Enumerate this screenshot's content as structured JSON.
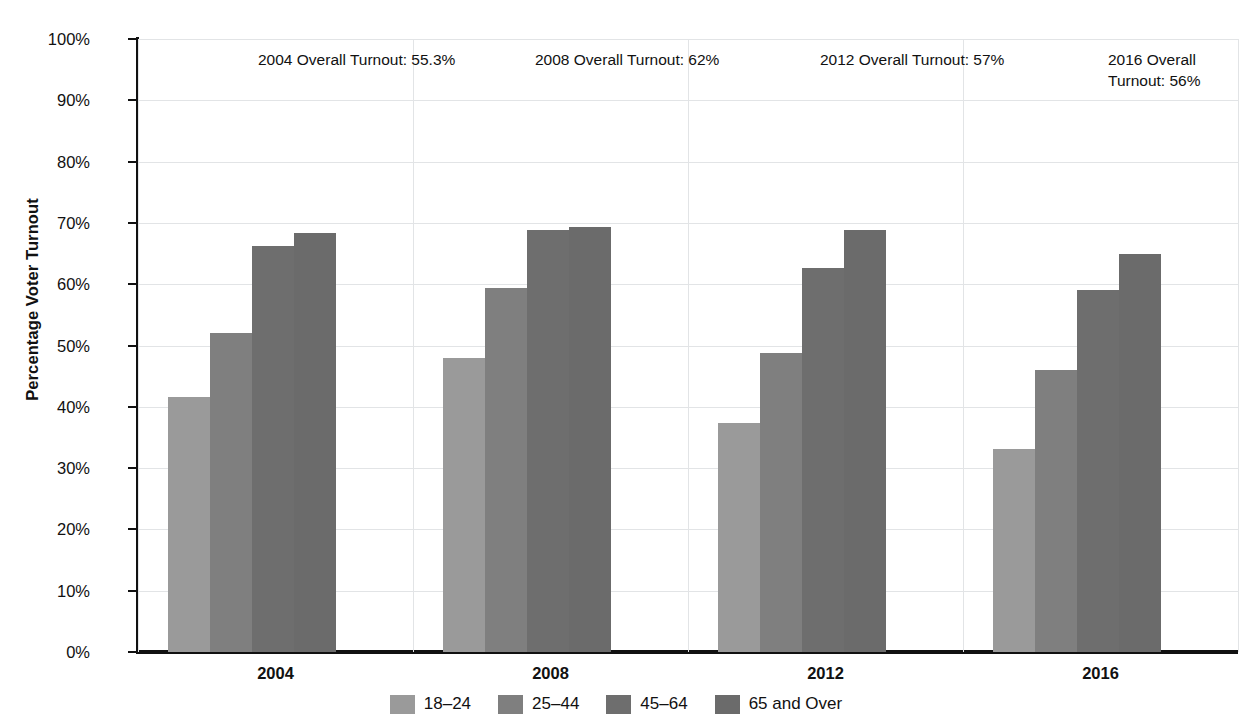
{
  "chart_data": {
    "type": "bar",
    "title": "",
    "xlabel": "",
    "ylabel": "Percentage Voter Turnout",
    "categories": [
      "2004",
      "2008",
      "2012",
      "2016"
    ],
    "ylim": [
      0,
      100
    ],
    "ytick_labels": [
      "0%",
      "10%",
      "20%",
      "30%",
      "40%",
      "50%",
      "60%",
      "70%",
      "80%",
      "90%",
      "100%"
    ],
    "ytick_values": [
      0,
      10,
      20,
      30,
      40,
      50,
      60,
      70,
      80,
      90,
      100
    ],
    "grid": true,
    "legend_position": "bottom",
    "series": [
      {
        "name": "18–24",
        "color": "#9a9a9a",
        "values": [
          41.6,
          48.0,
          37.3,
          33.1
        ]
      },
      {
        "name": "25–44",
        "color": "#7f7f7f",
        "values": [
          52.0,
          59.4,
          48.8,
          46.0
        ]
      },
      {
        "name": "45–64",
        "color": "#6e6e6e",
        "values": [
          66.2,
          68.8,
          62.6,
          59.0
        ]
      },
      {
        "name": "65 and Over",
        "color": "#6b6b6b",
        "values": [
          68.4,
          69.4,
          68.8,
          65.0
        ]
      }
    ],
    "annotations": [
      {
        "id": "turnout-2004",
        "text": "2004 Overall Turnout: 55.3%",
        "year": "2004",
        "value": "55.3%"
      },
      {
        "id": "turnout-2008",
        "text": "2008 Overall Turnout: 62%",
        "year": "2008",
        "value": "62%"
      },
      {
        "id": "turnout-2012",
        "text": "2012 Overall Turnout: 57%",
        "year": "2012",
        "value": "57%"
      },
      {
        "id": "turnout-2016",
        "text": "2016 Overall\nTurnout: 56%",
        "year": "2016",
        "value": "56%"
      }
    ]
  },
  "axis": {
    "y_title": "Percentage Voter Turnout"
  },
  "colors": {
    "grid": "#e2e4e6",
    "axis": "#111111",
    "text": "#111111",
    "background": "#ffffff"
  }
}
